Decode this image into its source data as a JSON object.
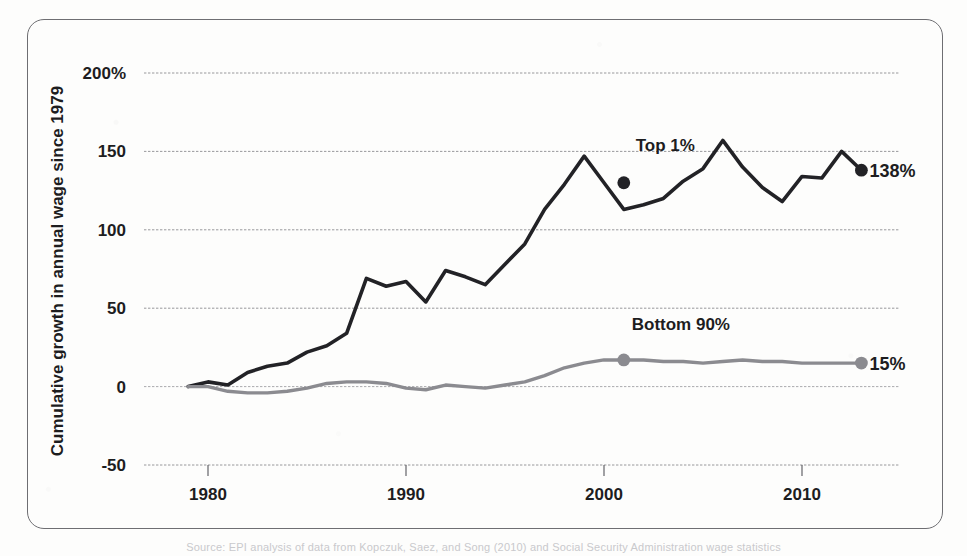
{
  "chart_data": {
    "type": "line",
    "title": "",
    "xlabel": "",
    "ylabel": "Cumulative growth in annual wage since 1979",
    "xlim": [
      1979,
      2013
    ],
    "ylim": [
      -60,
      215
    ],
    "grid": true,
    "legend_position": "inline-annotations",
    "x_ticks": [
      1980,
      1990,
      2000,
      2010
    ],
    "x_tick_labels": [
      "1980",
      "1990",
      "2000",
      "2010"
    ],
    "y_ticks": [
      -50,
      0,
      50,
      100,
      150,
      200
    ],
    "y_tick_labels": [
      "-50",
      "0",
      "50",
      "100",
      "150",
      "200%"
    ],
    "x": [
      1979,
      1980,
      1981,
      1982,
      1983,
      1984,
      1985,
      1986,
      1987,
      1988,
      1989,
      1990,
      1991,
      1992,
      1993,
      1994,
      1995,
      1996,
      1997,
      1998,
      1999,
      2000,
      2001,
      2002,
      2003,
      2004,
      2005,
      2006,
      2007,
      2008,
      2009,
      2010,
      2011,
      2012,
      2013
    ],
    "series": [
      {
        "name": "Top 1%",
        "color": "#222226",
        "label": "Top 1%",
        "end_label": "138%",
        "values": [
          0,
          3,
          1,
          9,
          13,
          15,
          22,
          26,
          34,
          69,
          64,
          67,
          54,
          74,
          70,
          65,
          78,
          91,
          113,
          129,
          147,
          130,
          113,
          116,
          120,
          131,
          139,
          157,
          140,
          127,
          118,
          134,
          133,
          150,
          138
        ],
        "markers": [
          {
            "x": 2001,
            "y": 130
          },
          {
            "x": 2013,
            "y": 138
          }
        ],
        "label_anchor": {
          "x": 2001.6,
          "y": 150
        }
      },
      {
        "name": "Bottom 90%",
        "color": "#8b8b90",
        "label": "Bottom 90%",
        "end_label": "15%",
        "values": [
          0,
          0,
          -3,
          -4,
          -4,
          -3,
          -1,
          2,
          3,
          3,
          2,
          -1,
          -2,
          1,
          0,
          -1,
          1,
          3,
          7,
          12,
          15,
          17,
          17,
          17,
          16,
          16,
          15,
          16,
          17,
          16,
          16,
          15,
          15,
          15,
          15
        ],
        "markers": [
          {
            "x": 2001,
            "y": 17
          },
          {
            "x": 2013,
            "y": 15
          }
        ],
        "label_anchor": {
          "x": 2001.4,
          "y": 36
        }
      }
    ]
  },
  "footer": {
    "source_note": "Source: EPI analysis of data from Kopczuk, Saez, and Song (2010) and Social Security Administration wage statistics"
  }
}
